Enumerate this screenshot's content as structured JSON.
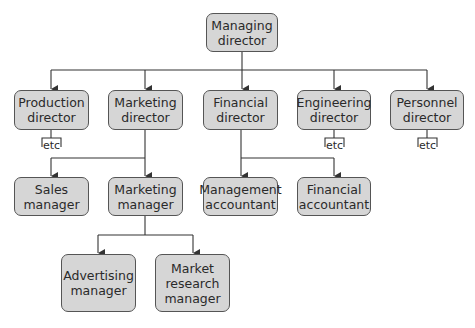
{
  "diagram": {
    "type": "organisation-chart",
    "nodes": {
      "managing_director": {
        "line1": "Managing",
        "line2": "director"
      },
      "production_director": {
        "line1": "Production",
        "line2": "director"
      },
      "marketing_director": {
        "line1": "Marketing",
        "line2": "director"
      },
      "financial_director": {
        "line1": "Financial",
        "line2": "director"
      },
      "engineering_director": {
        "line1": "Engineering",
        "line2": "director"
      },
      "personnel_director": {
        "line1": "Personnel",
        "line2": "director"
      },
      "sales_manager": {
        "line1": "Sales",
        "line2": "manager"
      },
      "marketing_manager": {
        "line1": "Marketing",
        "line2": "manager"
      },
      "management_accountant": {
        "line1": "Management",
        "line2": "accountant"
      },
      "financial_accountant": {
        "line1": "Financial",
        "line2": "accountant"
      },
      "advertising_manager": {
        "line1": "Advertising",
        "line2": "manager"
      },
      "market_research_manager": {
        "line1": "Market",
        "line2": "research",
        "line3": "manager"
      }
    },
    "etc_label": "etc",
    "edges": [
      [
        "managing_director",
        "production_director"
      ],
      [
        "managing_director",
        "marketing_director"
      ],
      [
        "managing_director",
        "financial_director"
      ],
      [
        "managing_director",
        "engineering_director"
      ],
      [
        "managing_director",
        "personnel_director"
      ],
      [
        "marketing_director",
        "sales_manager"
      ],
      [
        "marketing_director",
        "marketing_manager"
      ],
      [
        "financial_director",
        "management_accountant"
      ],
      [
        "financial_director",
        "financial_accountant"
      ],
      [
        "marketing_manager",
        "advertising_manager"
      ],
      [
        "marketing_manager",
        "market_research_manager"
      ]
    ],
    "colors": {
      "box_fill": "#d6d6d6",
      "box_border": "#555555",
      "line": "#333333"
    }
  }
}
